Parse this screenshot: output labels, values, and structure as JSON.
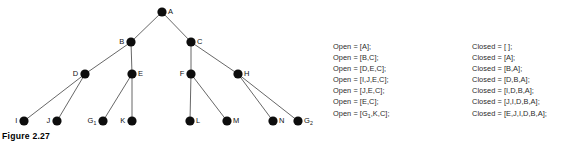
{
  "figure_tree": {
    "caption": "Figure 2.27",
    "nodes": [
      {
        "id": "A",
        "label": "A",
        "sub": "",
        "x": 162,
        "y": 12,
        "label_side": "right"
      },
      {
        "id": "B",
        "label": "B",
        "sub": "",
        "x": 131,
        "y": 42,
        "label_side": "left"
      },
      {
        "id": "C",
        "label": "C",
        "sub": "",
        "x": 191,
        "y": 42,
        "label_side": "right"
      },
      {
        "id": "D",
        "label": "D",
        "sub": "",
        "x": 85,
        "y": 74,
        "label_side": "left"
      },
      {
        "id": "E",
        "label": "E",
        "sub": "",
        "x": 132,
        "y": 74,
        "label_side": "right"
      },
      {
        "id": "F",
        "label": "F",
        "sub": "",
        "x": 191,
        "y": 74,
        "label_side": "left"
      },
      {
        "id": "H",
        "label": "H",
        "sub": "",
        "x": 238,
        "y": 74,
        "label_side": "right"
      },
      {
        "id": "I",
        "label": "I",
        "sub": "",
        "x": 24,
        "y": 121,
        "label_side": "left"
      },
      {
        "id": "J",
        "label": "J",
        "sub": "",
        "x": 57,
        "y": 121,
        "label_side": "left"
      },
      {
        "id": "G1",
        "label": "G",
        "sub": "1",
        "x": 103,
        "y": 121,
        "label_side": "left"
      },
      {
        "id": "K",
        "label": "K",
        "sub": "",
        "x": 132,
        "y": 121,
        "label_side": "left"
      },
      {
        "id": "L",
        "label": "L",
        "sub": "",
        "x": 190,
        "y": 121,
        "label_side": "right"
      },
      {
        "id": "M",
        "label": "M",
        "sub": "",
        "x": 227,
        "y": 121,
        "label_side": "right"
      },
      {
        "id": "N",
        "label": "N",
        "sub": "",
        "x": 273,
        "y": 121,
        "label_side": "right"
      },
      {
        "id": "G2",
        "label": "G",
        "sub": "2",
        "x": 298,
        "y": 121,
        "label_side": "right"
      }
    ],
    "edges": [
      [
        "A",
        "B"
      ],
      [
        "A",
        "C"
      ],
      [
        "B",
        "D"
      ],
      [
        "B",
        "E"
      ],
      [
        "C",
        "F"
      ],
      [
        "C",
        "H"
      ],
      [
        "D",
        "I"
      ],
      [
        "D",
        "J"
      ],
      [
        "E",
        "G1"
      ],
      [
        "E",
        "K"
      ],
      [
        "F",
        "L"
      ],
      [
        "F",
        "M"
      ],
      [
        "H",
        "N"
      ],
      [
        "H",
        "G2"
      ]
    ],
    "node_color": "#0d0d0d",
    "edge_color": "#565656"
  },
  "figure_lists": {
    "caption": "Figure 2.28",
    "open_list": [
      "Open = [A];",
      "Open = [B,C];",
      "Open = [D,E,C];",
      "Open = [I,J,E,C];",
      "Open = [J,E,C];",
      "Open = [E,C];",
      "Open = [G\u0001,K,C];"
    ],
    "open_lines": [
      {
        "prefix": "Open = [A];",
        "sub": "",
        "suffix": ""
      },
      {
        "prefix": "Open = [B,C];",
        "sub": "",
        "suffix": ""
      },
      {
        "prefix": "Open = [D,E,C];",
        "sub": "",
        "suffix": ""
      },
      {
        "prefix": "Open = [I,J,E,C];",
        "sub": "",
        "suffix": ""
      },
      {
        "prefix": "Open = [J,E,C];",
        "sub": "",
        "suffix": ""
      },
      {
        "prefix": "Open = [E,C];",
        "sub": "",
        "suffix": ""
      },
      {
        "prefix": "Open = [G",
        "sub": "1",
        "suffix": ",K,C];"
      }
    ],
    "closed_lines": [
      {
        "prefix": "Closed = [ ];",
        "sub": "",
        "suffix": ""
      },
      {
        "prefix": "Closed = [A];",
        "sub": "",
        "suffix": ""
      },
      {
        "prefix": "Closed = [B,A];",
        "sub": "",
        "suffix": ""
      },
      {
        "prefix": "Closed = [D,B,A];",
        "sub": "",
        "suffix": ""
      },
      {
        "prefix": "Closed = [I,D,B,A];",
        "sub": "",
        "suffix": ""
      },
      {
        "prefix": "Closed = [J,I,D,B,A];",
        "sub": "",
        "suffix": ""
      },
      {
        "prefix": "Closed = [E,J,I,D,B,A];",
        "sub": "",
        "suffix": ""
      }
    ]
  }
}
